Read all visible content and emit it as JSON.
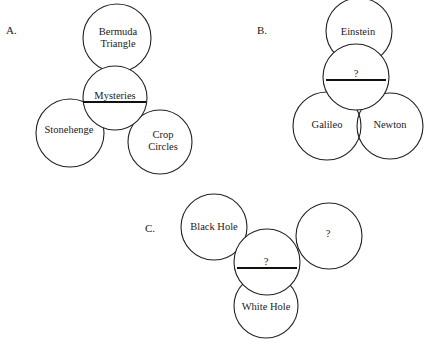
{
  "panels": [
    {
      "label": "A.",
      "center": "Mysteries",
      "circles": [
        "Bermuda Triangle",
        "Stonehenge",
        "Crop Circles"
      ],
      "bermuda_line1": "Bermuda",
      "bermuda_line2": "Triangle",
      "crop_line1": "Crop",
      "crop_line2": "Circles"
    },
    {
      "label": "B.",
      "center": "?",
      "circles": [
        "Einstein",
        "Galileo",
        "Newton"
      ]
    },
    {
      "label": "C.",
      "center": "?",
      "circles": [
        "Black Hole",
        "?",
        "White Hole"
      ]
    }
  ]
}
